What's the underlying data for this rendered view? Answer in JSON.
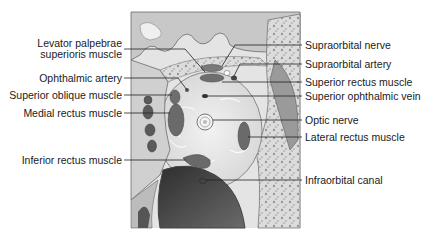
{
  "figure": {
    "colors": {
      "background": "#ffffff",
      "bone": "#d9d9d9",
      "bone_dark": "#8a8a8a",
      "fat": "#e8e8e8",
      "muscle": "#7a7a7a",
      "sinus": "#3a3a3a",
      "leader": "#222222",
      "text": "#1a1a1a"
    },
    "labels_left": [
      {
        "id": "levator",
        "lines": [
          "Levator palpebrae",
          "superioris muscle"
        ]
      },
      {
        "id": "ophthalmic-artery",
        "lines": [
          "Ophthalmic artery"
        ]
      },
      {
        "id": "superior-oblique",
        "lines": [
          "Superior oblique muscle"
        ]
      },
      {
        "id": "medial-rectus",
        "lines": [
          "Medial rectus muscle"
        ]
      },
      {
        "id": "inferior-rectus",
        "lines": [
          "Inferior rectus muscle"
        ]
      }
    ],
    "labels_right": [
      {
        "id": "supraorbital-nerve",
        "lines": [
          "Supraorbital nerve"
        ]
      },
      {
        "id": "supraorbital-artery",
        "lines": [
          "Supraorbital artery"
        ]
      },
      {
        "id": "superior-rectus",
        "lines": [
          "Superior rectus muscle"
        ]
      },
      {
        "id": "superior-ophthalmic-vein",
        "lines": [
          "Superior ophthalmic vein"
        ]
      },
      {
        "id": "optic-nerve",
        "lines": [
          "Optic nerve"
        ]
      },
      {
        "id": "lateral-rectus",
        "lines": [
          "Lateral rectus muscle"
        ]
      },
      {
        "id": "infraorbital-canal",
        "lines": [
          "Infraorbital canal"
        ]
      }
    ]
  }
}
